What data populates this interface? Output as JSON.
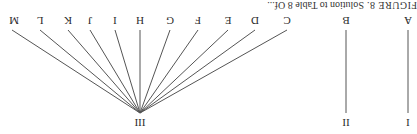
{
  "caption": {
    "figure_label": "FIGURE 8.",
    "text": "Solution to Table 8 Of..."
  },
  "diagram": {
    "type": "tree",
    "orientation_rotated_180": true,
    "roots": [
      {
        "label": "I",
        "children": [
          "A"
        ]
      },
      {
        "label": "II",
        "children": [
          "B"
        ]
      },
      {
        "label": "III",
        "children": [
          "C",
          "D",
          "E",
          "F",
          "G",
          "H",
          "I",
          "J",
          "K",
          "L",
          "M"
        ]
      }
    ],
    "leaves": [
      "A",
      "B",
      "C",
      "D",
      "E",
      "F",
      "G",
      "H",
      "I",
      "J",
      "K",
      "L",
      "M"
    ],
    "line_color": "#555555"
  }
}
